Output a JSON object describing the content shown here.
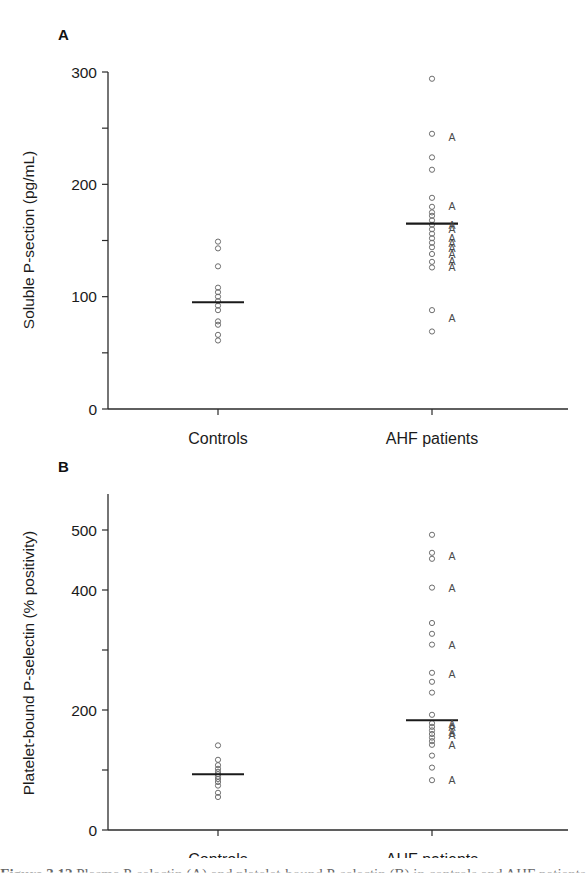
{
  "figure": {
    "caption_prefix": "Figure 3.12",
    "caption_text": "Plasma P-selectin (A) and platelet-bound P-selectin (B) in controls and AHF patients",
    "background_color": "#ffffff",
    "marker_color": "#6e6e6e",
    "line_color": "#1a1a1a",
    "axis_color": "#2a2a2a"
  },
  "panels": [
    {
      "id": "panel-a",
      "letter": "A",
      "ylabel": "Soluble P-section (pg/mL)",
      "categories": [
        "Controls",
        "AHF patients"
      ],
      "ytick_labels": [
        "0",
        "100",
        "200",
        "300"
      ],
      "yticks_all": [
        0,
        50,
        100,
        150,
        200,
        250,
        300
      ],
      "ylim": [
        0,
        300
      ],
      "medians": {
        "Controls": 95,
        "AHF patients": 165
      }
    },
    {
      "id": "panel-b",
      "letter": "B",
      "ylabel": "Platelet-bound P-selectin (% positivity)",
      "categories": [
        "Controls",
        "AHF patients"
      ],
      "ytick_labels": [
        "0",
        "200",
        "400",
        "500"
      ],
      "yticks_all": [
        0,
        100,
        200,
        300,
        400,
        500
      ],
      "ylim": [
        0,
        560
      ],
      "medians": {
        "Controls": 93,
        "AHF patients": 183
      }
    }
  ],
  "chart_data": [
    {
      "type": "scatter",
      "panel": "A",
      "title": "",
      "xlabel": "",
      "ylabel": "Soluble P-section (pg/mL)",
      "ylim": [
        0,
        300
      ],
      "yticks": [
        0,
        50,
        100,
        150,
        200,
        250,
        300
      ],
      "ytick_labels": [
        "0",
        "",
        "100",
        "",
        "200",
        "",
        "300"
      ],
      "grid": false,
      "legend": "none",
      "categories": [
        "Controls",
        "AHF patients"
      ],
      "series": [
        {
          "name": "Controls",
          "marker": "open-circle",
          "values": [
            149,
            143,
            127,
            108,
            104,
            100,
            96,
            92,
            88,
            78,
            75,
            66,
            61
          ],
          "median": 95
        },
        {
          "name": "AHF patients",
          "marker": "open-circle",
          "values": [
            294,
            245,
            224,
            213,
            188,
            180,
            175,
            172,
            168,
            164,
            160,
            156,
            152,
            148,
            144,
            138,
            131,
            126,
            88,
            69
          ],
          "median": 165
        },
        {
          "name": "AHF patients (A-labelled)",
          "marker": "letter-A",
          "values": [
            242,
            181,
            164,
            160,
            152,
            148,
            143,
            138,
            132,
            126,
            81
          ],
          "median": null
        }
      ]
    },
    {
      "type": "scatter",
      "panel": "B",
      "title": "",
      "xlabel": "",
      "ylabel": "Platelet-bound P-selectin (% positivity)",
      "ylim": [
        0,
        560
      ],
      "yticks": [
        0,
        100,
        200,
        300,
        400,
        500
      ],
      "ytick_labels": [
        "0",
        "",
        "200",
        "",
        "400",
        "500"
      ],
      "grid": false,
      "legend": "none",
      "categories": [
        "Controls",
        "AHF patients"
      ],
      "series": [
        {
          "name": "Controls",
          "marker": "open-circle",
          "values": [
            141,
            117,
            108,
            102,
            97,
            93,
            89,
            85,
            80,
            74,
            62,
            55
          ],
          "median": 93
        },
        {
          "name": "AHF patients",
          "marker": "open-circle",
          "values": [
            492,
            462,
            452,
            404,
            345,
            327,
            309,
            262,
            247,
            229,
            192,
            178,
            172,
            166,
            160,
            154,
            148,
            142,
            124,
            104,
            83
          ],
          "median": 183
        },
        {
          "name": "AHF patients (A-labelled)",
          "marker": "letter-A",
          "values": [
            457,
            403,
            308,
            260,
            176,
            172,
            163,
            158,
            142,
            83
          ],
          "median": null
        }
      ]
    }
  ]
}
